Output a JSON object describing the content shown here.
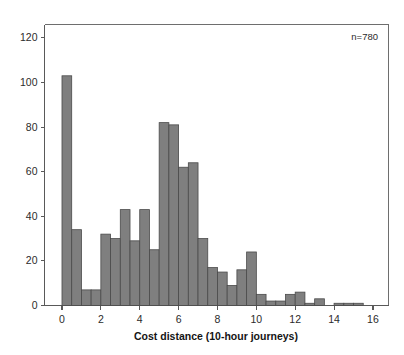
{
  "chart_data": {
    "type": "bar",
    "title": "",
    "subtitle": "",
    "xlabel": "Cost distance (10-hour journeys)",
    "ylabel": "",
    "xlim": [
      -0.9,
      16.8
    ],
    "ylim": [
      0,
      126
    ],
    "grid": false,
    "legend": null,
    "bin_width": 0.5,
    "annotations": [
      {
        "text": "n=780",
        "position": "top-right"
      }
    ],
    "xticks": [
      0,
      2,
      4,
      6,
      8,
      10,
      12,
      14,
      16
    ],
    "xtick_labels": [
      "0",
      "2",
      "4",
      "6",
      "8",
      "10",
      "12",
      "14",
      "16"
    ],
    "yticks": [
      0,
      20,
      40,
      60,
      80,
      100,
      120
    ],
    "ytick_labels": [
      "0",
      "20",
      "40",
      "60",
      "80",
      "100",
      "120"
    ],
    "bar_color": "#7f7f7f",
    "bar_edge_color": "#4a4a4a",
    "categories": [
      "0.0",
      "0.5",
      "1.0",
      "1.5",
      "2.0",
      "2.5",
      "3.0",
      "3.5",
      "4.0",
      "4.5",
      "5.0",
      "5.5",
      "6.0",
      "6.5",
      "7.0",
      "7.5",
      "8.0",
      "8.5",
      "9.0",
      "9.5",
      "10.0",
      "10.5",
      "11.0",
      "11.5",
      "12.0",
      "12.5",
      "13.0",
      "13.5",
      "14.0",
      "14.5",
      "15.0"
    ],
    "bin_starts": [
      0.0,
      0.5,
      1.0,
      1.5,
      2.0,
      2.5,
      3.0,
      3.5,
      4.0,
      4.5,
      5.0,
      5.5,
      6.0,
      6.5,
      7.0,
      7.5,
      8.0,
      8.5,
      9.0,
      9.5,
      10.0,
      10.5,
      11.0,
      11.5,
      12.0,
      12.5,
      13.0,
      13.5,
      14.0,
      14.5,
      15.0
    ],
    "values": [
      103,
      34,
      7,
      7,
      32,
      30,
      43,
      29,
      43,
      25,
      82,
      81,
      62,
      64,
      30,
      17,
      15,
      9,
      16,
      24,
      5,
      2,
      2,
      5,
      6,
      1,
      3,
      0,
      1,
      1,
      1
    ]
  },
  "footer": {
    "sample_size_label": "n=780"
  }
}
